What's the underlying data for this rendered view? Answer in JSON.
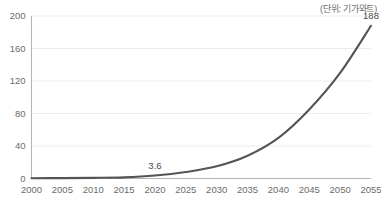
{
  "unit_note": "(단위: 기가와트)",
  "chart_data": {
    "type": "line",
    "title": "",
    "subtitle": "",
    "xlabel": "",
    "ylabel": "",
    "unit_note": "(단위: 기가와트)",
    "grid": true,
    "legend": false,
    "legend_position": "none",
    "line_color": "#555555",
    "grid_color": "#ececec",
    "axis_color": "#b5b5b5",
    "label_color": "#6b6b6b",
    "categories": [
      "2000",
      "2005",
      "2010",
      "2015",
      "2020",
      "2025",
      "2030",
      "2035",
      "2040",
      "2045",
      "2050",
      "2055"
    ],
    "x": [
      2000,
      2005,
      2010,
      2015,
      2020,
      2025,
      2030,
      2035,
      2040,
      2045,
      2050,
      2055
    ],
    "values": [
      0.3,
      0.5,
      0.8,
      1.4,
      3.6,
      8,
      15,
      28,
      50,
      85,
      130,
      188
    ],
    "xlim": [
      2000,
      2055
    ],
    "ylim": [
      0,
      200
    ],
    "yticks": [
      0,
      40,
      80,
      120,
      160,
      200
    ],
    "ytick_labels": [
      "0",
      "40",
      "80",
      "120",
      "160",
      "200"
    ],
    "xticks": [
      2000,
      2005,
      2010,
      2015,
      2020,
      2025,
      2030,
      2035,
      2040,
      2045,
      2050,
      2055
    ],
    "xtick_labels": [
      "2000",
      "2005",
      "2010",
      "2015",
      "2020",
      "2025",
      "2030",
      "2035",
      "2040",
      "2045",
      "2050",
      "2055"
    ],
    "annotations": [
      {
        "x": 2020,
        "y": 3.6,
        "label": "3.6"
      },
      {
        "x": 2055,
        "y": 188,
        "label": "188"
      }
    ]
  }
}
